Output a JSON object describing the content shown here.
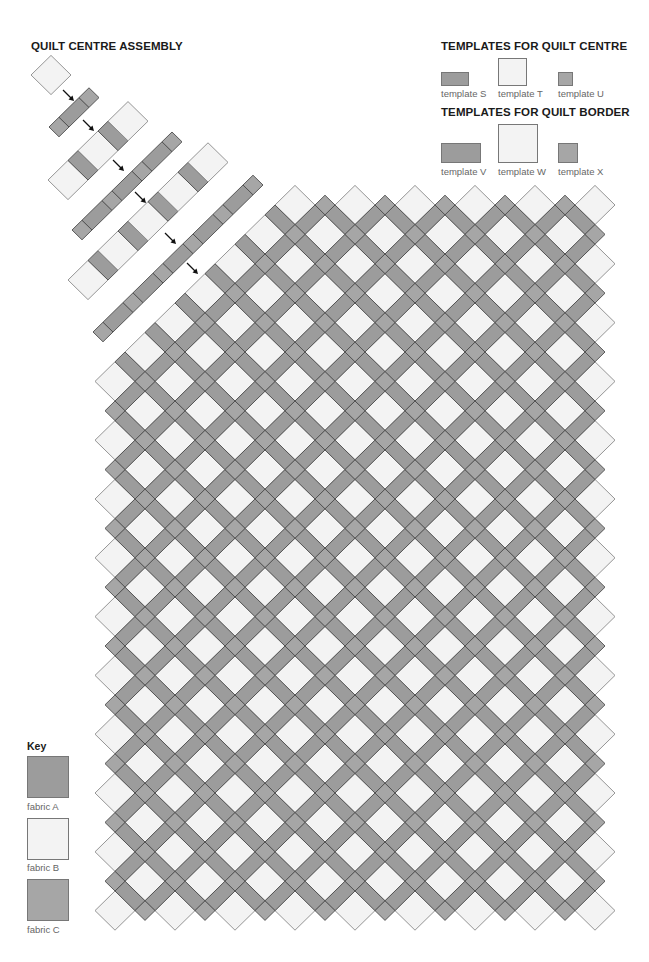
{
  "assembly": {
    "title": "QUILT CENTRE ASSEMBLY",
    "rows": [
      {
        "pattern": "T",
        "count": 1,
        "start": [
          51,
          75
        ]
      },
      {
        "pattern": "U",
        "count": 3,
        "start": [
          59,
          127
        ]
      },
      {
        "pattern": "T",
        "count": 5,
        "start": [
          68,
          180
        ]
      },
      {
        "pattern": "U",
        "count": 7,
        "start": [
          82,
          230
        ]
      },
      {
        "pattern": "T",
        "count": 9,
        "start": [
          88,
          280
        ]
      },
      {
        "pattern": "U",
        "count": 11,
        "start": [
          103,
          332
        ]
      }
    ],
    "arrows": [
      [
        68,
        95
      ],
      [
        88,
        125
      ],
      [
        118,
        165
      ],
      [
        140,
        197
      ],
      [
        170,
        238
      ],
      [
        192,
        268
      ]
    ]
  },
  "templates_centre": {
    "title": "TEMPLATES FOR QUILT CENTRE",
    "items": [
      {
        "label": "template S",
        "fabric": "A",
        "x": 441,
        "y": 72,
        "w": 28,
        "h": 14
      },
      {
        "label": "template T",
        "fabric": "B",
        "x": 498,
        "y": 58,
        "w": 29,
        "h": 28
      },
      {
        "label": "template U",
        "fabric": "C",
        "x": 558,
        "y": 72,
        "w": 15,
        "h": 14
      }
    ]
  },
  "templates_border": {
    "title": "TEMPLATES FOR QUILT BORDER",
    "items": [
      {
        "label": "template V",
        "fabric": "A",
        "x": 441,
        "y": 143,
        "w": 40,
        "h": 20
      },
      {
        "label": "template W",
        "fabric": "B",
        "x": 498,
        "y": 124,
        "w": 40,
        "h": 39
      },
      {
        "label": "template X",
        "fabric": "C",
        "x": 558,
        "y": 143,
        "w": 20,
        "h": 20
      }
    ]
  },
  "key": {
    "title": "Key",
    "items": [
      {
        "label": "fabric A",
        "fabric": "A"
      },
      {
        "label": "fabric B",
        "fabric": "B"
      },
      {
        "label": "fabric C",
        "fabric": "C"
      }
    ]
  },
  "fabrics": {
    "A": "#9c9c9c",
    "B": "#f3f3f3",
    "C": "#a6a6a6"
  },
  "quilt": {
    "origin": [
      355,
      205
    ],
    "step_x": 30,
    "step_y": 29.4,
    "m_range": [
      -8,
      8
    ],
    "n_range": [
      0,
      24
    ],
    "min_u": -1
  }
}
